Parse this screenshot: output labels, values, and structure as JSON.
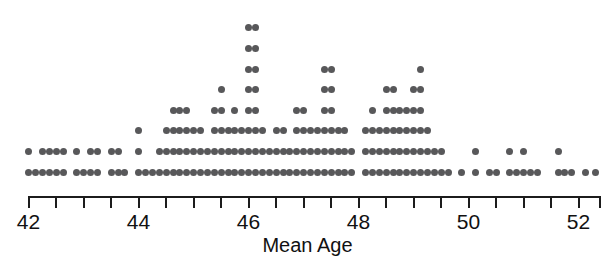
{
  "figure": {
    "kind": "dotplot",
    "background_color": "#ffffff",
    "dot_color": "#58585a",
    "axis_color": "#1c1c1c",
    "width": 615,
    "height": 268
  },
  "axis": {
    "title": "Mean Age",
    "tick_labels": [
      "42",
      "44",
      "46",
      "48",
      "50",
      "52"
    ],
    "labeled_tick_values": [
      42,
      44,
      46,
      48,
      50,
      52
    ],
    "minor_tick_step": 0.5,
    "range": [
      42,
      52.4
    ],
    "tick_values": [
      42,
      42.5,
      43,
      43.5,
      44,
      44.5,
      45,
      45.5,
      46,
      46.5,
      47,
      47.5,
      48,
      48.5,
      49,
      49.5,
      50,
      50.5,
      51,
      51.5,
      52
    ]
  },
  "chart_data": {
    "type": "scatter",
    "title": "",
    "xlabel": "Mean Age",
    "ylabel": "",
    "xlim": [
      42,
      52.4
    ],
    "grid": false,
    "legend": null,
    "bin_width": 0.127,
    "note": "Stacked dot plot: each dot is one observation; columns are binned values of Mean Age.",
    "columns": [
      {
        "x": 42.0,
        "count": 2
      },
      {
        "x": 42.13,
        "count": 1
      },
      {
        "x": 42.25,
        "count": 2
      },
      {
        "x": 42.38,
        "count": 2
      },
      {
        "x": 42.5,
        "count": 2
      },
      {
        "x": 42.63,
        "count": 2
      },
      {
        "x": 42.88,
        "count": 2
      },
      {
        "x": 43.0,
        "count": 1
      },
      {
        "x": 43.13,
        "count": 2
      },
      {
        "x": 43.25,
        "count": 2
      },
      {
        "x": 43.5,
        "count": 2
      },
      {
        "x": 43.63,
        "count": 2
      },
      {
        "x": 43.75,
        "count": 1
      },
      {
        "x": 44.0,
        "count": 3
      },
      {
        "x": 44.13,
        "count": 1
      },
      {
        "x": 44.25,
        "count": 1
      },
      {
        "x": 44.38,
        "count": 2
      },
      {
        "x": 44.5,
        "count": 3
      },
      {
        "x": 44.63,
        "count": 4
      },
      {
        "x": 44.75,
        "count": 4
      },
      {
        "x": 44.88,
        "count": 4
      },
      {
        "x": 45.0,
        "count": 3
      },
      {
        "x": 45.13,
        "count": 3
      },
      {
        "x": 45.25,
        "count": 2
      },
      {
        "x": 45.38,
        "count": 4
      },
      {
        "x": 45.5,
        "count": 5
      },
      {
        "x": 45.63,
        "count": 3
      },
      {
        "x": 45.75,
        "count": 4
      },
      {
        "x": 45.88,
        "count": 3
      },
      {
        "x": 46.0,
        "count": 8
      },
      {
        "x": 46.13,
        "count": 8
      },
      {
        "x": 46.25,
        "count": 3
      },
      {
        "x": 46.38,
        "count": 2
      },
      {
        "x": 46.5,
        "count": 3
      },
      {
        "x": 46.63,
        "count": 3
      },
      {
        "x": 46.75,
        "count": 2
      },
      {
        "x": 46.88,
        "count": 4
      },
      {
        "x": 47.0,
        "count": 4
      },
      {
        "x": 47.13,
        "count": 3
      },
      {
        "x": 47.25,
        "count": 3
      },
      {
        "x": 47.38,
        "count": 6
      },
      {
        "x": 47.5,
        "count": 6
      },
      {
        "x": 47.63,
        "count": 3
      },
      {
        "x": 47.75,
        "count": 3
      },
      {
        "x": 47.88,
        "count": 2
      },
      {
        "x": 48.13,
        "count": 3
      },
      {
        "x": 48.25,
        "count": 4
      },
      {
        "x": 48.38,
        "count": 3
      },
      {
        "x": 48.5,
        "count": 5
      },
      {
        "x": 48.63,
        "count": 5
      },
      {
        "x": 48.75,
        "count": 4
      },
      {
        "x": 48.88,
        "count": 4
      },
      {
        "x": 49.0,
        "count": 5
      },
      {
        "x": 49.13,
        "count": 6
      },
      {
        "x": 49.25,
        "count": 3
      },
      {
        "x": 49.38,
        "count": 2
      },
      {
        "x": 49.5,
        "count": 2
      },
      {
        "x": 49.63,
        "count": 1
      },
      {
        "x": 49.88,
        "count": 1
      },
      {
        "x": 50.13,
        "count": 2
      },
      {
        "x": 50.38,
        "count": 1
      },
      {
        "x": 50.5,
        "count": 1
      },
      {
        "x": 50.75,
        "count": 2
      },
      {
        "x": 50.88,
        "count": 1
      },
      {
        "x": 51.0,
        "count": 2
      },
      {
        "x": 51.13,
        "count": 1
      },
      {
        "x": 51.25,
        "count": 1
      },
      {
        "x": 51.63,
        "count": 2
      },
      {
        "x": 51.75,
        "count": 1
      },
      {
        "x": 51.88,
        "count": 1
      },
      {
        "x": 52.13,
        "count": 1
      },
      {
        "x": 52.3,
        "count": 1
      }
    ]
  }
}
